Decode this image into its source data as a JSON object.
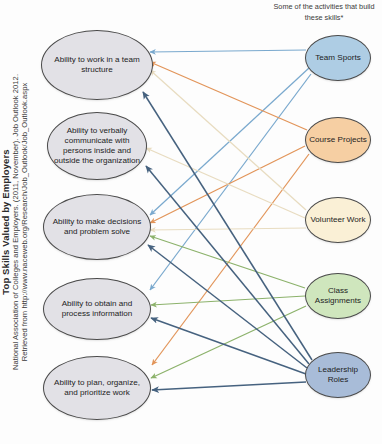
{
  "figure": {
    "side_caption": {
      "title": "Top Skills Valued by Employers",
      "citation_line_1": "National Association of Colleges and Employers. (2011, November). Job Outlook 2012.",
      "citation_line_2": "Retrieved from http://www.naceweb.org/Research/Job_Outlook/Job_Outlook.aspx"
    },
    "right_heading": "Some of the activities that build these skills*"
  },
  "chart_data": {
    "type": "diagram",
    "title": "Top Skills Valued by Employers",
    "subtitle": "Some of the activities that build these skills*",
    "layout": "bipartite-directed-graph, activities (right) point to skills (left)",
    "skills": [
      {
        "id": "team-structure",
        "label": "Ability to work in a team structure",
        "cx": 97,
        "cy": 65,
        "rx": 56,
        "ry": 35
      },
      {
        "id": "communicate",
        "label": "Ability to verbally communicate with persons inside and outside the organization",
        "cx": 97,
        "cy": 146,
        "rx": 50,
        "ry": 34
      },
      {
        "id": "decisions",
        "label": "Ability to make decisions and problem solve",
        "cx": 97,
        "cy": 227,
        "rx": 54,
        "ry": 33
      },
      {
        "id": "obtain-process",
        "label": "Ability to obtain and process information",
        "cx": 97,
        "cy": 309,
        "rx": 54,
        "ry": 31
      },
      {
        "id": "plan-organize",
        "label": "Ability to plan, organize, and prioritize work",
        "cx": 97,
        "cy": 388,
        "rx": 54,
        "ry": 32
      }
    ],
    "activities": [
      {
        "id": "team-sports",
        "label": "Team Sports",
        "color": "#aecde4",
        "cx": 338,
        "cy": 58,
        "rx": 33,
        "ry": 23
      },
      {
        "id": "course-projects",
        "label": "Course Projects",
        "color": "#f6cfa3",
        "cx": 338,
        "cy": 140,
        "rx": 33,
        "ry": 23
      },
      {
        "id": "volunteer-work",
        "label": "Volunteer Work",
        "color": "#faf0d6",
        "cx": 338,
        "cy": 220,
        "rx": 33,
        "ry": 23
      },
      {
        "id": "class-assignments",
        "label": "Class Assignments",
        "color": "#cfe6bd",
        "cx": 338,
        "cy": 296,
        "rx": 33,
        "ry": 23
      },
      {
        "id": "leadership-roles",
        "label": "Leadership Roles",
        "color": "#a8bcd8",
        "cx": 338,
        "cy": 375,
        "rx": 33,
        "ry": 23
      }
    ],
    "edge_colors": {
      "team-sports": "#7aa9ce",
      "course-projects": "#e2955a",
      "volunteer-work": "#e8dcc0",
      "class-assignments": "#8cb26b",
      "leadership-roles": "#46627f"
    },
    "edges": [
      {
        "from": "team-sports",
        "to": "team-structure",
        "from_pt": [
          306,
          50
        ],
        "to_pt": [
          150,
          52
        ]
      },
      {
        "from": "team-sports",
        "to": "decisions",
        "from_pt": [
          309,
          68
        ],
        "to_pt": [
          150,
          215
        ]
      },
      {
        "from": "team-sports",
        "to": "obtain-process",
        "from_pt": [
          311,
          74
        ],
        "to_pt": [
          150,
          290
        ]
      },
      {
        "from": "course-projects",
        "to": "team-structure",
        "from_pt": [
          307,
          130
        ],
        "to_pt": [
          150,
          62
        ]
      },
      {
        "from": "course-projects",
        "to": "decisions",
        "from_pt": [
          305,
          146
        ],
        "to_pt": [
          150,
          223
        ]
      },
      {
        "from": "course-projects",
        "to": "plan-organize",
        "from_pt": [
          309,
          154
        ],
        "to_pt": [
          152,
          365
        ]
      },
      {
        "from": "volunteer-work",
        "to": "team-structure",
        "from_pt": [
          306,
          210
        ],
        "to_pt": [
          150,
          70
        ]
      },
      {
        "from": "volunteer-work",
        "to": "communicate",
        "from_pt": [
          305,
          218
        ],
        "to_pt": [
          146,
          148
        ]
      },
      {
        "from": "volunteer-work",
        "to": "decisions",
        "from_pt": [
          306,
          228
        ],
        "to_pt": [
          150,
          230
        ]
      },
      {
        "from": "class-assignments",
        "to": "decisions",
        "from_pt": [
          305,
          288
        ],
        "to_pt": [
          150,
          236
        ]
      },
      {
        "from": "class-assignments",
        "to": "obtain-process",
        "from_pt": [
          305,
          296
        ],
        "to_pt": [
          151,
          305
        ]
      },
      {
        "from": "class-assignments",
        "to": "plan-organize",
        "from_pt": [
          306,
          306
        ],
        "to_pt": [
          151,
          378
        ]
      },
      {
        "from": "leadership-roles",
        "to": "team-structure",
        "from_pt": [
          312,
          360
        ],
        "to_pt": [
          143,
          92
        ]
      },
      {
        "from": "leadership-roles",
        "to": "communicate",
        "from_pt": [
          309,
          364
        ],
        "to_pt": [
          146,
          166
        ]
      },
      {
        "from": "leadership-roles",
        "to": "decisions",
        "from_pt": [
          307,
          368
        ],
        "to_pt": [
          148,
          245
        ]
      },
      {
        "from": "leadership-roles",
        "to": "obtain-process",
        "from_pt": [
          306,
          374
        ],
        "to_pt": [
          151,
          318
        ]
      },
      {
        "from": "leadership-roles",
        "to": "plan-organize",
        "from_pt": [
          306,
          382
        ],
        "to_pt": [
          152,
          390
        ]
      }
    ]
  },
  "footer": {
    "clipped_text": ""
  }
}
